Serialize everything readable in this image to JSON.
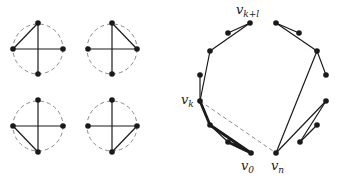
{
  "colors": {
    "ink": "#1a1a1a",
    "dashed": "#8a8a8a",
    "background": "#ffffff"
  },
  "small_circles": [
    {
      "id": "c1",
      "center": [
        38,
        49
      ],
      "radius": 25,
      "extra_edge": [
        "left",
        "top"
      ]
    },
    {
      "id": "c2",
      "center": [
        112,
        49
      ],
      "radius": 25,
      "extra_edge": [
        "top",
        "right"
      ]
    },
    {
      "id": "c3",
      "center": [
        38,
        126
      ],
      "radius": 25,
      "extra_edge": [
        "left",
        "bottom"
      ]
    },
    {
      "id": "c4",
      "center": [
        112,
        126
      ],
      "radius": 25,
      "extra_edge": [
        "right",
        "bottom"
      ]
    }
  ],
  "large_graph": {
    "vertices": [
      {
        "id": "v0",
        "pos": [
          251,
          153
        ]
      },
      {
        "id": "a1",
        "pos": [
          228,
          142
        ]
      },
      {
        "id": "a2",
        "pos": [
          210,
          125
        ]
      },
      {
        "id": "vk",
        "pos": [
          200,
          101
        ]
      },
      {
        "id": "a4",
        "pos": [
          200,
          75
        ]
      },
      {
        "id": "a5",
        "pos": [
          210,
          51
        ]
      },
      {
        "id": "a6",
        "pos": [
          228,
          33
        ]
      },
      {
        "id": "vkl",
        "pos": [
          250,
          23
        ]
      },
      {
        "id": "b1",
        "pos": [
          276,
          23
        ]
      },
      {
        "id": "b2",
        "pos": [
          299,
          33
        ]
      },
      {
        "id": "b3",
        "pos": [
          317,
          51
        ]
      },
      {
        "id": "b4",
        "pos": [
          326,
          75
        ]
      },
      {
        "id": "b5",
        "pos": [
          326,
          101
        ]
      },
      {
        "id": "b6",
        "pos": [
          317,
          125
        ]
      },
      {
        "id": "b7",
        "pos": [
          300,
          142
        ]
      },
      {
        "id": "vn",
        "pos": [
          276,
          153
        ]
      }
    ],
    "thick_edges": [
      [
        "vk",
        "a2"
      ],
      [
        "a2",
        "v0"
      ],
      [
        "v0",
        "a1"
      ]
    ],
    "thin_edges": [
      [
        "a1",
        "a2"
      ],
      [
        "vk",
        "a4"
      ],
      [
        "vk",
        "a5"
      ],
      [
        "a5",
        "vkl"
      ],
      [
        "vkl",
        "a6"
      ],
      [
        "b1",
        "b2"
      ],
      [
        "b1",
        "b3"
      ],
      [
        "b3",
        "b4"
      ],
      [
        "b3",
        "vn"
      ],
      [
        "vn",
        "b5"
      ],
      [
        "b5",
        "b7"
      ],
      [
        "b7",
        "b6"
      ]
    ],
    "dashed_edges": [
      [
        "vk",
        "vn"
      ]
    ]
  },
  "labels": {
    "v0": {
      "base": "v",
      "sub": "0"
    },
    "vn": {
      "base": "v",
      "sub": "n"
    },
    "vk": {
      "base": "v",
      "sub": "k"
    },
    "vkl": {
      "base": "v",
      "sub": "k+l"
    }
  }
}
